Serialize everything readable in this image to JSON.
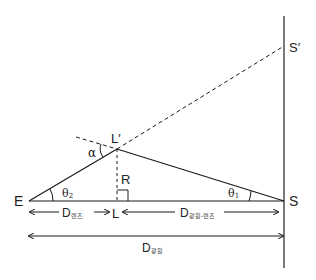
{
  "diagram": {
    "points": {
      "E": "E",
      "L": "L",
      "L_prime": "L′",
      "S": "S",
      "S_prime": "S′",
      "R": "R"
    },
    "angles": {
      "alpha": "α",
      "theta1": "θ",
      "theta1_sub": "1",
      "theta2": "θ",
      "theta2_sub": "2"
    },
    "dimensions": {
      "d_lens": {
        "main": "D",
        "sub": "렌즈"
      },
      "d_source_lens": {
        "main": "D",
        "sub": "광원-렌즈"
      },
      "d_source": {
        "main": "D",
        "sub": "광원"
      }
    },
    "colors": {
      "line": "#1a1a1a",
      "background": "#ffffff"
    }
  }
}
